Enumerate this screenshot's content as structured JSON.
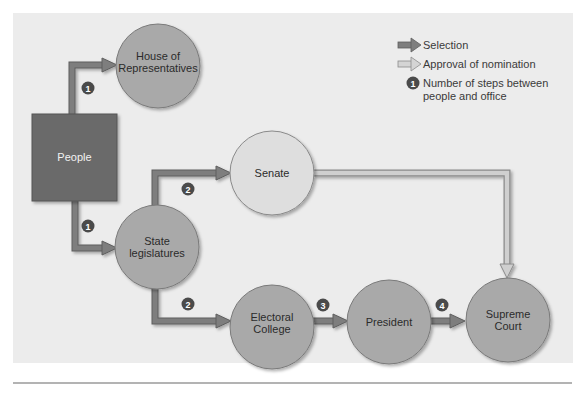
{
  "colors": {
    "panel_bg": "#ececec",
    "people_box": "#6b6b6b",
    "dark_circle": "#a9a9a9",
    "light_circle": "#dedede",
    "selection_arrow": "#7a7a7a",
    "approval_arrow": "#c4c4c4",
    "badge": "#4a4a4a",
    "rule": "#9a9a9a"
  },
  "legend": {
    "selection": "Selection",
    "approval": "Approval of nomination",
    "steps_line1": "Number of steps between",
    "steps_line2": "people and office",
    "steps_badge": "1"
  },
  "nodes": {
    "people": "People",
    "house": {
      "line1": "House of",
      "line2": "Representatives"
    },
    "senate": "Senate",
    "state": {
      "line1": "State",
      "line2": "legislatures"
    },
    "electoral": {
      "line1": "Electoral",
      "line2": "College"
    },
    "president": "President",
    "court": {
      "line1": "Supreme",
      "line2": "Court"
    }
  },
  "badges": {
    "people_to_house": "1",
    "people_to_state": "1",
    "state_to_senate": "2",
    "state_to_electoral": "2",
    "electoral_to_president": "3",
    "president_to_court": "4"
  }
}
